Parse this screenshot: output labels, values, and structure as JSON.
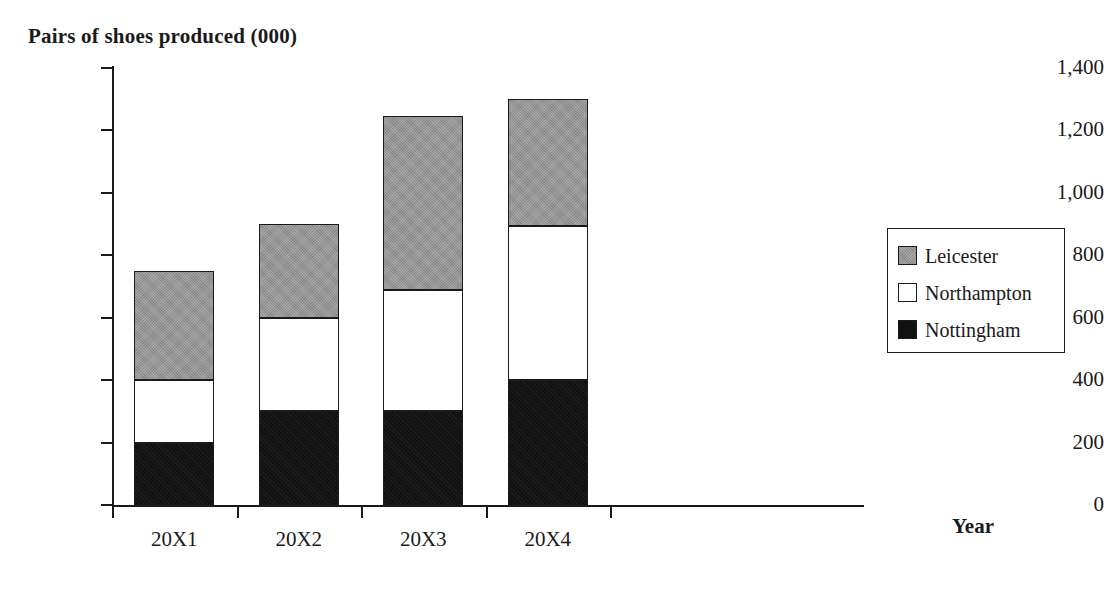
{
  "chart_data": {
    "type": "bar",
    "subtype": "stacked-bar",
    "title": "Pairs of shoes produced (000)",
    "xlabel": "Year",
    "ylabel": "",
    "categories": [
      "20X1",
      "20X2",
      "20X3",
      "20X4"
    ],
    "series": [
      {
        "name": "Nottingham",
        "color": "#111111",
        "values": [
          200,
          300,
          300,
          400
        ]
      },
      {
        "name": "Northampton",
        "color": "#ffffff",
        "values": [
          200,
          300,
          390,
          495
        ]
      },
      {
        "name": "Leicester",
        "color": "#969696",
        "values": [
          350,
          300,
          555,
          405
        ]
      }
    ],
    "stack_totals": [
      750,
      900,
      1245,
      1300
    ],
    "ylim": [
      0,
      1400
    ],
    "ytick_values": [
      0,
      200,
      400,
      600,
      800,
      1000,
      1200,
      1400
    ],
    "ytick_labels": [
      "0",
      "200",
      "400",
      "600",
      "800",
      "1,000",
      "1,200",
      "1,400"
    ],
    "grid": false,
    "legend_position": "right",
    "legend_order": [
      "Leicester",
      "Northampton",
      "Nottingham"
    ]
  },
  "legend": {
    "items": [
      {
        "label": "Leicester",
        "swatch": "gray-swatch-icon"
      },
      {
        "label": "Northampton",
        "swatch": "white-swatch-icon"
      },
      {
        "label": "Nottingham",
        "swatch": "black-swatch-icon"
      }
    ]
  }
}
